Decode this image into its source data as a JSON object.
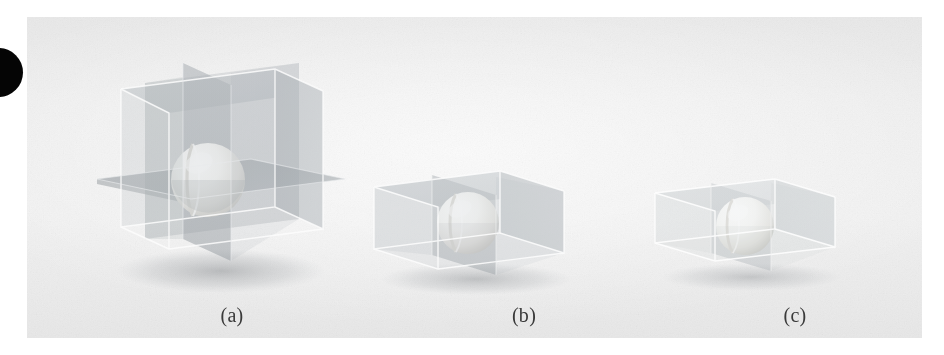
{
  "figure": {
    "kind": "scanned-photographic-plate",
    "background_color": "#ededed",
    "page_background": "#ffffff",
    "marker": {
      "name": "page-edge-dot",
      "color": "#050505",
      "shape": "circle"
    },
    "panels": [
      {
        "id": "a",
        "caption": "(a)",
        "description": "Transparent cube containing a shaded sphere, subdivided by one horizontal and two vertical cutting planes",
        "box_shape": "tall-cube",
        "cut_planes": [
          "horizontal",
          "vertical-left-right",
          "vertical-front-back"
        ],
        "sphere": "split into eight octants",
        "glass_tint": "#b9bec2",
        "glass_opacity": 0.42
      },
      {
        "id": "b",
        "caption": "(b)",
        "description": "Flatter transparent box containing a shaded sphere, subdivided by a single vertical cutting plane",
        "box_shape": "wide-box",
        "cut_planes": [
          "vertical-front-back"
        ],
        "sphere": "split into two halves",
        "glass_tint": "#bfc4c7",
        "glass_opacity": 0.36
      },
      {
        "id": "c",
        "caption": "(c)",
        "description": "Low transparent box containing a shaded sphere, subdivided by a single vertical cutting plane",
        "box_shape": "low-box",
        "cut_planes": [
          "vertical-front-back"
        ],
        "sphere": "split into two halves",
        "glass_tint": "#ccd0d3",
        "glass_opacity": 0.28
      }
    ],
    "captions": {
      "a": "(a)",
      "b": "(b)",
      "c": "(c)"
    }
  }
}
